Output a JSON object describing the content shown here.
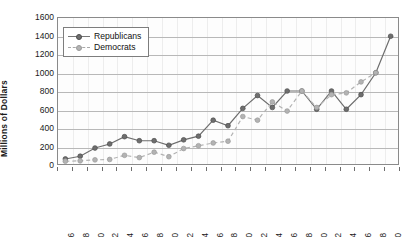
{
  "chart_data": {
    "type": "line",
    "title": "",
    "xlabel": "",
    "ylabel": "Millions of Dollars",
    "ylim": [
      0,
      1600
    ],
    "ytick_step": 200,
    "yticks": [
      1600,
      1400,
      1200,
      1000,
      800,
      600,
      400,
      200,
      0
    ],
    "grid": true,
    "legend_position": "top-left",
    "categories": [
      "1975-76",
      "1977-78",
      "1979-80",
      "1981-82",
      "1983-84",
      "1985-86",
      "1987-88",
      "1989-90",
      "1991-92",
      "1993-94",
      "1995-96",
      "1997-98",
      "1999-2000",
      "2001-02",
      "2003-04",
      "2005-06",
      "2007-08",
      "2009-10",
      "2011-12",
      "2013-14",
      "2015-16",
      "2017-18",
      "2019-20"
    ],
    "series": [
      {
        "name": "Republicans",
        "color": "#6e6e6e",
        "line_style": "solid",
        "marker": "circle",
        "values": [
          55,
          85,
          175,
          220,
          300,
          255,
          255,
          205,
          265,
          305,
          480,
          420,
          610,
          750,
          620,
          800,
          800,
          600,
          800,
          600,
          760,
          1000,
          1400
        ]
      },
      {
        "name": "Democrats",
        "color": "#b3b3b3",
        "line_style": "dashed",
        "marker": "circle",
        "values": [
          30,
          35,
          45,
          50,
          95,
          70,
          130,
          80,
          170,
          200,
          230,
          250,
          520,
          480,
          680,
          580,
          800,
          620,
          760,
          780,
          900,
          1000,
          null
        ]
      }
    ]
  },
  "legend": {
    "items": [
      {
        "label": "Republicans"
      },
      {
        "label": "Democrats"
      }
    ]
  }
}
